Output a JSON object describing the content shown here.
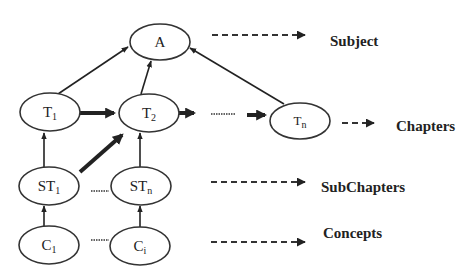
{
  "diagram": {
    "nodes": [
      {
        "id": "A",
        "label": "A",
        "sub": "",
        "cx": 160,
        "cy": 42
      },
      {
        "id": "T1",
        "label": "T",
        "sub": "1",
        "cx": 50,
        "cy": 112
      },
      {
        "id": "T2",
        "label": "T",
        "sub": "2",
        "cx": 149,
        "cy": 113
      },
      {
        "id": "Tn",
        "label": "T",
        "sub": "n",
        "cx": 300,
        "cy": 121
      },
      {
        "id": "ST1",
        "label": "ST",
        "sub": "1",
        "cx": 49,
        "cy": 186
      },
      {
        "id": "STn",
        "label": "ST",
        "sub": "n",
        "cx": 141,
        "cy": 186
      },
      {
        "id": "C1",
        "label": "C",
        "sub": "1",
        "cx": 49,
        "cy": 245
      },
      {
        "id": "Ci",
        "label": "C",
        "sub": "i",
        "cx": 140,
        "cy": 246
      }
    ],
    "edges": [
      {
        "from": "T1",
        "to": "A",
        "style": "thin"
      },
      {
        "from": "T2",
        "to": "A",
        "style": "thin"
      },
      {
        "from": "Tn",
        "to": "A",
        "style": "thin"
      },
      {
        "from": "T1",
        "to": "T2",
        "style": "thick"
      },
      {
        "from": "T2",
        "to": "Tn",
        "style": "thick",
        "note": "with dotted gap"
      },
      {
        "from": "ST1",
        "to": "T1",
        "style": "thin"
      },
      {
        "from": "ST1",
        "to": "T2",
        "style": "thick"
      },
      {
        "from": "STn",
        "to": "T2",
        "style": "thin"
      },
      {
        "from": "C1",
        "to": "ST1",
        "style": "thin"
      },
      {
        "from": "Ci",
        "to": "STn",
        "style": "thin"
      }
    ],
    "levels": [
      {
        "label": "Subject"
      },
      {
        "label": "Chapters"
      },
      {
        "label": "SubChapters"
      },
      {
        "label": "Concepts"
      }
    ],
    "colors": {
      "stroke": "#222222",
      "background": "#ffffff"
    }
  }
}
